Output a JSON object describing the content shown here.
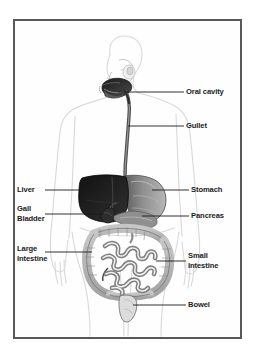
{
  "figure": {
    "border_color": "#58585a",
    "background_color": "#ffffff",
    "body_outline_color": "#d8d8d8"
  },
  "labels": [
    {
      "id": "oral-cavity",
      "text": "Oral cavity",
      "lines": [
        "Oral cavity"
      ],
      "side": "right"
    },
    {
      "id": "gullet",
      "text": "Gullet",
      "lines": [
        "Gullet"
      ],
      "side": "right"
    },
    {
      "id": "stomach",
      "text": "Stomach",
      "lines": [
        "Stomach"
      ],
      "side": "right"
    },
    {
      "id": "pancreas",
      "text": "Pancreas",
      "lines": [
        "Pancreas"
      ],
      "side": "right"
    },
    {
      "id": "small-intestine",
      "text": "Small intestine",
      "lines": [
        "Small",
        "Intestine"
      ],
      "side": "right"
    },
    {
      "id": "bowel",
      "text": "Bowel",
      "lines": [
        "Bowel"
      ],
      "side": "right"
    },
    {
      "id": "liver",
      "text": "Liver",
      "lines": [
        "Liver"
      ],
      "side": "left"
    },
    {
      "id": "gall-bladder",
      "text": "Gall Bladder",
      "lines": [
        "Gall",
        "Bladder"
      ],
      "side": "left"
    },
    {
      "id": "large-intestine",
      "text": "Large Intestine",
      "lines": [
        "Large",
        "Intestine"
      ],
      "side": "left"
    }
  ],
  "label_text": {
    "oral_cavity": "Oral cavity",
    "gullet": "Gullet",
    "stomach": "Stomach",
    "pancreas": "Pancreas",
    "small_intestine_line1": "Small",
    "small_intestine_line2": "Intestine",
    "bowel": "Bowel",
    "liver": "Liver",
    "gall_line1": "Gall",
    "gall_line2": "Bladder",
    "large_line1": "Large",
    "large_line2": "Intestine"
  },
  "organs": [
    {
      "name": "oral-cavity",
      "shade": "#2a2a2a"
    },
    {
      "name": "gullet",
      "shade": "#6b6b6b"
    },
    {
      "name": "liver",
      "shade": "#1a1a1a"
    },
    {
      "name": "stomach",
      "shade": "#9a9a9a"
    },
    {
      "name": "gall-bladder",
      "shade": "#3a3a3a"
    },
    {
      "name": "pancreas",
      "shade": "#8d8d8d"
    },
    {
      "name": "large-intestine",
      "shade": "#b4b4b4"
    },
    {
      "name": "small-intestine",
      "shade": "#c9c9c9"
    },
    {
      "name": "bowel",
      "shade": "#d0d0d0"
    }
  ]
}
